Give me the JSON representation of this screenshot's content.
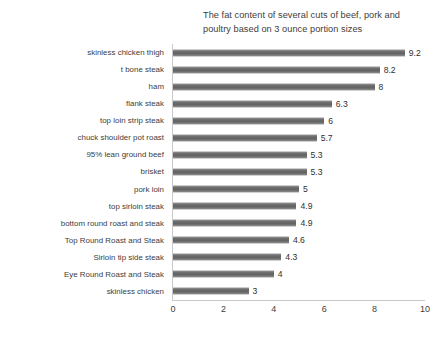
{
  "chart_data": {
    "type": "bar",
    "orientation": "horizontal",
    "title": "The fat content of several cuts of beef, pork and poultry based on 3 ounce portion sizes",
    "title_line1": "The fat content of several cuts of beef, pork and",
    "title_line2": "poultry based on 3 ounce portion sizes",
    "xlabel": "",
    "ylabel": "",
    "xlim": [
      0,
      10
    ],
    "xticks": [
      0,
      2,
      4,
      6,
      8,
      10
    ],
    "grid": false,
    "legend": false,
    "bar_color": "#6d6d6d",
    "axis_color": "#c9c9c9",
    "categories": [
      "skinless chicken thigh",
      "t bone steak",
      "ham",
      "flank steak",
      "top loin strip steak",
      "chuck shoulder pot roast",
      "95% lean ground beef",
      "brisket",
      "pork loin",
      "top sirloin steak",
      "bottom round roast and steak",
      "Top Round Roast and Steak",
      "Sirloin tip side steak",
      "Eye Round Roast and Steak",
      "skinless chicken"
    ],
    "values": [
      9.2,
      8.2,
      8,
      6.3,
      6,
      5.7,
      5.3,
      5.3,
      5,
      4.9,
      4.9,
      4.6,
      4.3,
      4,
      3
    ],
    "value_labels": [
      "9.2",
      "8.2",
      "8",
      "6.3",
      "6",
      "5.7",
      "5.3",
      "5.3",
      "5",
      "4.9",
      "4.9",
      "4.6",
      "4.3",
      "4",
      "3"
    ]
  }
}
